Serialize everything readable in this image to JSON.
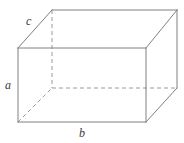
{
  "figure": {
    "shape_name": "rectangular prism",
    "background_color": "#ffffff",
    "solid_edge_color": "#808080",
    "hidden_edge_color": "#9a9a9a",
    "label_color": "#3a3a3a",
    "canvas": {
      "width": 184,
      "height": 143
    }
  },
  "labels": {
    "height": "a",
    "width": "b",
    "depth": "c"
  },
  "geometry": {
    "front_face": [
      {
        "x": 18,
        "y": 48
      },
      {
        "x": 146,
        "y": 48
      },
      {
        "x": 146,
        "y": 122
      },
      {
        "x": 18,
        "y": 122
      }
    ],
    "back_face": [
      {
        "x": 52,
        "y": 10
      },
      {
        "x": 177,
        "y": 10
      },
      {
        "x": 177,
        "y": 88
      },
      {
        "x": 52,
        "y": 88
      }
    ],
    "hidden_vertex": {
      "x": 52,
      "y": 88
    },
    "solid_edges": [
      {
        "name": "front-top",
        "x1": 18,
        "y1": 48,
        "x2": 146,
        "y2": 48
      },
      {
        "name": "front-right",
        "x1": 146,
        "y1": 48,
        "x2": 146,
        "y2": 122
      },
      {
        "name": "front-bottom",
        "x1": 18,
        "y1": 122,
        "x2": 146,
        "y2": 122
      },
      {
        "name": "front-left",
        "x1": 18,
        "y1": 48,
        "x2": 18,
        "y2": 122
      },
      {
        "name": "back-top",
        "x1": 52,
        "y1": 10,
        "x2": 177,
        "y2": 10
      },
      {
        "name": "back-right",
        "x1": 177,
        "y1": 10,
        "x2": 177,
        "y2": 88
      },
      {
        "name": "depth-top-left",
        "x1": 18,
        "y1": 48,
        "x2": 52,
        "y2": 10
      },
      {
        "name": "depth-top-right",
        "x1": 146,
        "y1": 48,
        "x2": 177,
        "y2": 10
      },
      {
        "name": "depth-bottom-right",
        "x1": 146,
        "y1": 122,
        "x2": 177,
        "y2": 88
      }
    ],
    "hidden_edges": [
      {
        "name": "hidden-vertical",
        "x1": 52,
        "y1": 10,
        "x2": 52,
        "y2": 88
      },
      {
        "name": "hidden-back-bottom",
        "x1": 52,
        "y1": 88,
        "x2": 177,
        "y2": 88
      },
      {
        "name": "hidden-depth-bottom-left",
        "x1": 18,
        "y1": 122,
        "x2": 52,
        "y2": 88
      }
    ],
    "label_positions": {
      "height": {
        "x": 8,
        "y": 85
      },
      "width": {
        "x": 82,
        "y": 133
      },
      "depth": {
        "x": 30,
        "y": 22
      }
    }
  }
}
